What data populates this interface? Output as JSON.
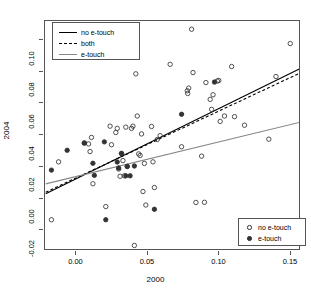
{
  "chart_data": {
    "type": "scatter",
    "title": "",
    "xlabel": "2000",
    "ylabel": "2004",
    "xlim": [
      -0.022,
      0.157
    ],
    "ylim": [
      -0.033,
      0.112
    ],
    "xticks": [
      "0.00",
      "0.05",
      "0.10",
      "0.15"
    ],
    "xtick_values": [
      0.0,
      0.05,
      0.1,
      0.15
    ],
    "yticks": [
      "-0.02",
      "0.00",
      "0.02",
      "0.04",
      "0.06",
      "0.08",
      "0.10"
    ],
    "ytick_values": [
      -0.02,
      0.0,
      0.02,
      0.04,
      0.06,
      0.08,
      0.1
    ],
    "grid": false,
    "legend_position": [
      "top-left",
      "bottom-right"
    ],
    "series": [
      {
        "name": "no e-touch",
        "marker": "open-circle",
        "color": "#333333",
        "points": [
          [
            -0.0175,
            -0.0133
          ],
          [
            -0.0125,
            0.0232
          ],
          [
            0.0055,
            0.0352
          ],
          [
            0.0085,
            0.0345
          ],
          [
            0.0095,
            0.0297
          ],
          [
            0.0105,
            0.0386
          ],
          [
            0.0115,
            0.0094
          ],
          [
            0.0205,
            -0.005
          ],
          [
            0.0235,
            0.0457
          ],
          [
            0.0245,
            0.034
          ],
          [
            0.0275,
            0.0417
          ],
          [
            0.0285,
            0.0443
          ],
          [
            0.0295,
            0.0187
          ],
          [
            0.0305,
            0.0141
          ],
          [
            0.0315,
            0.0285
          ],
          [
            0.0325,
            0.024
          ],
          [
            0.0335,
            0.0144
          ],
          [
            0.0345,
            0.0451
          ],
          [
            0.0355,
            0.0203
          ],
          [
            0.0385,
            0.0443
          ],
          [
            0.0395,
            0.0457
          ],
          [
            0.0405,
            -0.0295
          ],
          [
            0.0415,
            0.0787
          ],
          [
            0.0425,
            0.0521
          ],
          [
            0.0435,
            0.0282
          ],
          [
            0.0445,
            0.0272
          ],
          [
            0.0455,
            0.0408
          ],
          [
            0.0465,
            0.0045
          ],
          [
            0.0475,
            0.0222
          ],
          [
            0.0485,
            -0.004
          ],
          [
            0.0525,
            0.0455
          ],
          [
            0.0535,
            0.0232
          ],
          [
            0.0545,
            0.007
          ],
          [
            0.0565,
            0.0373
          ],
          [
            0.0585,
            0.0397
          ],
          [
            0.0655,
            0.0847
          ],
          [
            0.0735,
            0.0327
          ],
          [
            0.0775,
            0.068
          ],
          [
            0.0778,
            0.0663
          ],
          [
            0.0785,
            0.0697
          ],
          [
            0.0805,
            0.1068
          ],
          [
            0.0815,
            0.0795
          ],
          [
            0.0835,
            -0.0024
          ],
          [
            0.0875,
            0.0268
          ],
          [
            0.0895,
            -0.0023
          ],
          [
            0.0905,
            0.0732
          ],
          [
            0.0935,
            0.0626
          ],
          [
            0.0945,
            0.0563
          ],
          [
            0.0955,
            0.0655
          ],
          [
            0.0985,
            0.0742
          ],
          [
            0.0995,
            0.0745
          ],
          [
            0.1005,
            0.0487
          ],
          [
            0.1035,
            0.0521
          ],
          [
            0.1085,
            0.0833
          ],
          [
            0.1105,
            0.0517
          ],
          [
            0.1175,
            0.0463
          ],
          [
            0.1345,
            0.0375
          ],
          [
            0.1395,
            0.077
          ],
          [
            0.1495,
            0.0978
          ]
        ]
      },
      {
        "name": "e-touch",
        "marker": "filled-circle",
        "color": "#333333",
        "points": [
          [
            -0.0175,
            0.018
          ],
          [
            -0.0065,
            0.0305
          ],
          [
            0.0055,
            0.035
          ],
          [
            0.0115,
            0.0223
          ],
          [
            0.0125,
            0.0147
          ],
          [
            0.0195,
            0.0358
          ],
          [
            0.0205,
            -0.0133
          ],
          [
            0.0285,
            0.0231
          ],
          [
            0.0295,
            0.0193
          ],
          [
            0.0315,
            0.0285
          ],
          [
            0.0345,
            0.0144
          ],
          [
            0.0355,
            0.0203
          ],
          [
            0.0375,
            0.0144
          ],
          [
            0.0405,
            0.0206
          ],
          [
            0.0545,
            -0.0067
          ],
          [
            0.0735,
            0.0532
          ],
          [
            0.0965,
            0.0735
          ]
        ]
      }
    ],
    "lines": [
      {
        "name": "no e-touch",
        "style": "solid",
        "color": "#000000",
        "x0": -0.0215,
        "y0": 0.0031,
        "x1": 0.1565,
        "y1": 0.0821
      },
      {
        "name": "both",
        "style": "dashed",
        "color": "#000000",
        "x0": -0.0215,
        "y0": 0.0041,
        "x1": 0.1565,
        "y1": 0.0793
      },
      {
        "name": "e-touch",
        "style": "solid",
        "color": "#888888",
        "x0": -0.0215,
        "y0": 0.0093,
        "x1": 0.1565,
        "y1": 0.0482
      }
    ]
  },
  "legend_lines": {
    "items": [
      {
        "label": "no e-touch",
        "key": "solid-black-line-key"
      },
      {
        "label": "both",
        "key": "dashed-black-line-key"
      },
      {
        "label": "e-touch",
        "key": "solid-gray-line-key"
      }
    ]
  },
  "legend_points": {
    "items": [
      {
        "label": "no e-touch",
        "key": "open-circle-marker-key"
      },
      {
        "label": "e-touch",
        "key": "filled-circle-marker-key"
      }
    ]
  }
}
